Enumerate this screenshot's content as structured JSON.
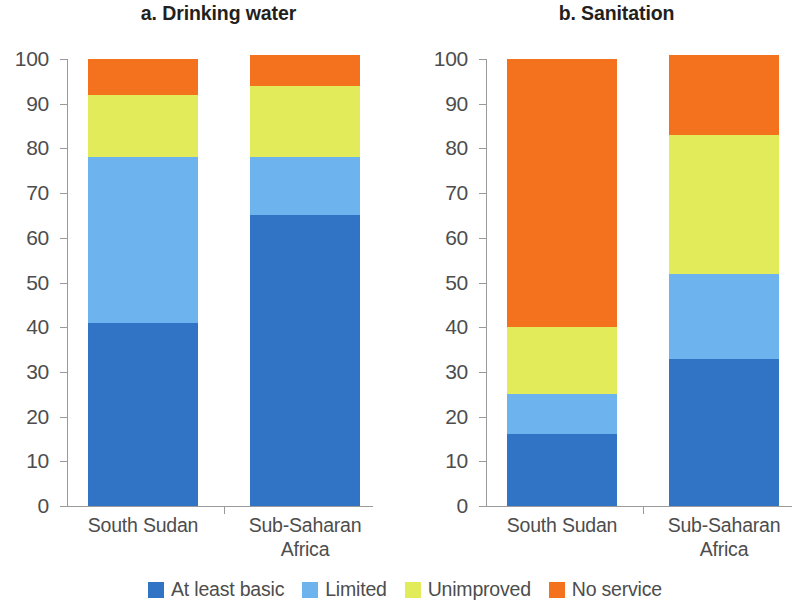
{
  "chart_data": {
    "type": "bar",
    "subtype": "stacked-100",
    "title": "",
    "panels": [
      {
        "id": "a",
        "title": "a. Drinking water",
        "xlabel": "",
        "ylabel": "",
        "ylim": [
          0,
          100
        ],
        "yticks": [
          0,
          10,
          20,
          30,
          40,
          50,
          60,
          70,
          80,
          90,
          100
        ],
        "ytick_labels": [
          "0",
          "10",
          "20",
          "30",
          "40",
          "50",
          "60",
          "70",
          "80",
          "90",
          "100"
        ],
        "grid": false,
        "categories": [
          "South Sudan",
          "Sub-Saharan\nAfrica"
        ],
        "series": [
          {
            "name": "At least basic",
            "color": "#3173c4",
            "values": [
              41,
              65
            ]
          },
          {
            "name": "Limited",
            "color": "#6db4ef",
            "values": [
              37,
              13
            ]
          },
          {
            "name": "Unimproved",
            "color": "#e2ec5b",
            "values": [
              14,
              16
            ]
          },
          {
            "name": "No service",
            "color": "#f4711e",
            "values": [
              8,
              7
            ]
          }
        ]
      },
      {
        "id": "b",
        "title": "b. Sanitation",
        "xlabel": "",
        "ylabel": "",
        "ylim": [
          0,
          100
        ],
        "yticks": [
          0,
          10,
          20,
          30,
          40,
          50,
          60,
          70,
          80,
          90,
          100
        ],
        "ytick_labels": [
          "0",
          "10",
          "20",
          "30",
          "40",
          "50",
          "60",
          "70",
          "80",
          "90",
          "100"
        ],
        "grid": false,
        "categories": [
          "South Sudan",
          "Sub-Saharan\nAfrica"
        ],
        "series": [
          {
            "name": "At least basic",
            "color": "#3173c4",
            "values": [
              16,
              33
            ]
          },
          {
            "name": "Limited",
            "color": "#6db4ef",
            "values": [
              9,
              19
            ]
          },
          {
            "name": "Unimproved",
            "color": "#e2ec5b",
            "values": [
              15,
              31
            ]
          },
          {
            "name": "No service",
            "color": "#f4711e",
            "values": [
              60,
              18
            ]
          }
        ]
      }
    ],
    "legend": {
      "position": "bottom",
      "entries": [
        {
          "label": "At least basic",
          "color": "#3173c4"
        },
        {
          "label": "Limited",
          "color": "#6db4ef"
        },
        {
          "label": "Unimproved",
          "color": "#e2ec5b"
        },
        {
          "label": "No service",
          "color": "#f4711e"
        }
      ]
    }
  },
  "colors": {
    "at_least_basic": "#3173c4",
    "limited": "#6db4ef",
    "unimproved": "#e2ec5b",
    "no_service": "#f4711e",
    "axis": "#9a9a9a",
    "text": "#4d4d4d",
    "title_text": "#231f20",
    "background": "#ffffff"
  }
}
